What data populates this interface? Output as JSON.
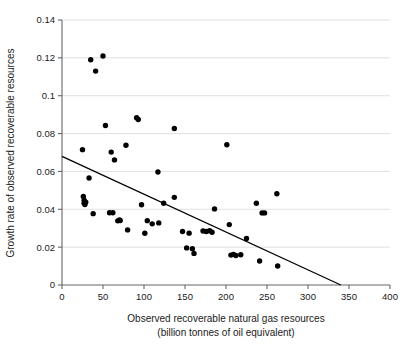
{
  "chart_data": {
    "type": "scatter",
    "title": "",
    "xlabel": "Observed recoverable natural gas resources",
    "xlabel_line2": "(billion tonnes of oil equivalent)",
    "ylabel": "Growth rate of observed recoverable resources",
    "xlim": [
      0,
      400
    ],
    "ylim": [
      0,
      0.14
    ],
    "xticks": [
      0,
      50,
      100,
      150,
      200,
      250,
      300,
      350,
      400
    ],
    "xtick_labels": [
      "0",
      "50",
      "100",
      "150",
      "200",
      "250",
      "300",
      "350",
      "400"
    ],
    "yticks": [
      0,
      0.02,
      0.04,
      0.06,
      0.08,
      0.1,
      0.12,
      0.14
    ],
    "ytick_labels": [
      "0",
      "0.02",
      "0.04",
      "0.06",
      "0.08",
      "0.1",
      "0.12",
      "0.14"
    ],
    "grid": "horizontal",
    "legend": "none",
    "point_color": "#000000",
    "point_radius": 2.7,
    "grid_color": "#d8d8d8",
    "axis_color": "#666666",
    "trend_line": {
      "label": "linear fit",
      "x": [
        0,
        340
      ],
      "y": [
        0.068,
        0.0
      ],
      "color": "#000000",
      "slope": -0.0002,
      "intercept": 0.068
    },
    "x": [
      35,
      41,
      50,
      25,
      53,
      60,
      64,
      78,
      91,
      93,
      137,
      201,
      33,
      58,
      71,
      117,
      26,
      27,
      27,
      28,
      29,
      38,
      62,
      68,
      70,
      80,
      97,
      101,
      104,
      110,
      118,
      124,
      137,
      147,
      155,
      152,
      159,
      161,
      172,
      176,
      180,
      183,
      186,
      204,
      225,
      206,
      209,
      212,
      218,
      237,
      244,
      241,
      262,
      247,
      263
    ],
    "y": [
      0.119,
      0.113,
      0.121,
      0.0715,
      0.0843,
      0.0702,
      0.0661,
      0.0738,
      0.0884,
      0.0874,
      0.0827,
      0.0741,
      0.0565,
      0.0382,
      0.0341,
      0.0597,
      0.0468,
      0.0448,
      0.0432,
      0.0425,
      0.0438,
      0.0377,
      0.0382,
      0.0339,
      0.0343,
      0.0291,
      0.0424,
      0.0273,
      0.034,
      0.0323,
      0.0328,
      0.0432,
      0.0463,
      0.0283,
      0.0274,
      0.0196,
      0.0192,
      0.0167,
      0.0285,
      0.0283,
      0.0287,
      0.0279,
      0.0402,
      0.0319,
      0.0246,
      0.0158,
      0.0162,
      0.0156,
      0.016,
      0.0432,
      0.0381,
      0.0127,
      0.0482,
      0.0381,
      0.01
    ]
  }
}
